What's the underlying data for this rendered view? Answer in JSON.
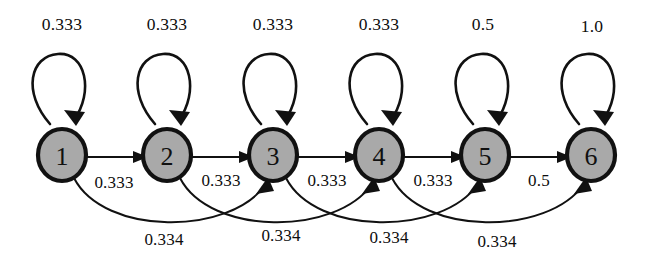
{
  "diagram": {
    "type": "markov-chain-state-transition-diagram",
    "node_fill_color": "#a9a9a9",
    "node_stroke_color": "#111111",
    "background_color": "#ffffff",
    "nodes": [
      {
        "id": "1",
        "label": "1",
        "cx": 62,
        "cy": 155
      },
      {
        "id": "2",
        "label": "2",
        "cx": 167,
        "cy": 155
      },
      {
        "id": "3",
        "label": "3",
        "cx": 273,
        "cy": 155
      },
      {
        "id": "4",
        "label": "4",
        "cx": 379,
        "cy": 155
      },
      {
        "id": "5",
        "label": "5",
        "cx": 485,
        "cy": 155
      },
      {
        "id": "6",
        "label": "6",
        "cx": 591,
        "cy": 155
      }
    ],
    "self_loops": [
      {
        "from": "1",
        "to": "1",
        "weight": "0.333",
        "label_x": 62,
        "label_y": 24
      },
      {
        "from": "2",
        "to": "2",
        "weight": "0.333",
        "label_x": 167,
        "label_y": 24
      },
      {
        "from": "3",
        "to": "3",
        "weight": "0.333",
        "label_x": 273,
        "label_y": 24
      },
      {
        "from": "4",
        "to": "4",
        "weight": "0.333",
        "label_x": 379,
        "label_y": 24
      },
      {
        "from": "5",
        "to": "5",
        "weight": "0.5",
        "label_x": 483,
        "label_y": 24
      },
      {
        "from": "6",
        "to": "6",
        "weight": "1.0",
        "label_x": 592,
        "label_y": 26
      }
    ],
    "forward_edges": [
      {
        "from": "1",
        "to": "2",
        "weight": "0.333",
        "label_x": 114,
        "label_y": 183
      },
      {
        "from": "2",
        "to": "3",
        "weight": "0.333",
        "label_x": 221,
        "label_y": 181
      },
      {
        "from": "3",
        "to": "4",
        "weight": "0.333",
        "label_x": 327,
        "label_y": 181
      },
      {
        "from": "4",
        "to": "5",
        "weight": "0.333",
        "label_x": 433,
        "label_y": 181
      },
      {
        "from": "5",
        "to": "6",
        "weight": "0.5",
        "label_x": 539,
        "label_y": 181
      }
    ],
    "skip_edges": [
      {
        "from": "1",
        "to": "3",
        "weight": "0.334",
        "label_x": 164,
        "label_y": 240
      },
      {
        "from": "2",
        "to": "4",
        "weight": "0.334",
        "label_x": 281,
        "label_y": 236
      },
      {
        "from": "3",
        "to": "5",
        "weight": "0.334",
        "label_x": 389,
        "label_y": 238
      },
      {
        "from": "4",
        "to": "6",
        "weight": "0.334",
        "label_x": 497,
        "label_y": 242
      }
    ]
  }
}
